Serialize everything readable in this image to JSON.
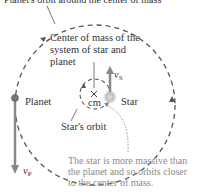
{
  "diagram": {
    "top_caption": "Planet's orbit around the center of mass",
    "cm_label": "Center of mass of the system of star and planet",
    "cm_label_lines": [
      "Center of mass of the",
      "system of star and",
      "planet"
    ],
    "cm_marker": "cm",
    "planet_label": "Planet",
    "star_label": "Star",
    "star_orbit_label": "Star's orbit",
    "velocity_star": {
      "symbol": "v",
      "subscript": "S"
    },
    "velocity_planet": {
      "symbol": "v",
      "subscript": "P"
    },
    "note_lines": [
      "The star is more massive than",
      "the planet and so orbits closer",
      "to the center of mass."
    ],
    "colors": {
      "text": "#333333",
      "note_text": "#8a8a8a",
      "orbit_dash": "#555555",
      "arrow": "#888888",
      "star": "#c8c8c8",
      "planet": "#777777"
    }
  }
}
